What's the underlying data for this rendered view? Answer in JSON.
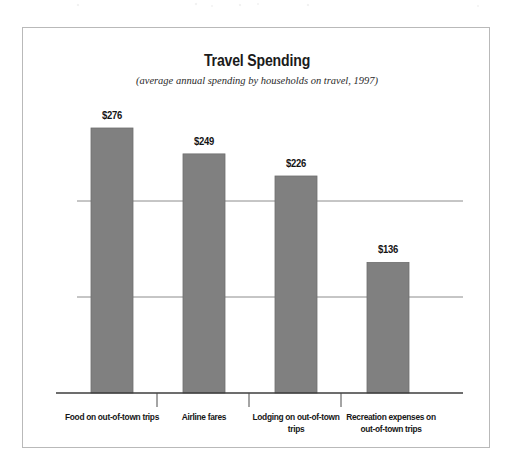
{
  "figure": {
    "title": "Travel Spending",
    "subtitle": "(average annual spending by households on travel, 1997)",
    "border_color": "#b9b9b9",
    "background_color": "#ffffff"
  },
  "chart_data": {
    "type": "bar",
    "title": "Travel Spending",
    "subtitle": "(average annual spending by households on travel, 1997)",
    "xlabel": "",
    "ylabel": "",
    "categories": [
      "Food on out-of-town trips",
      "Airline fares",
      "Lodging on out-of-town trips",
      "Recreation expenses on out-of-town trips"
    ],
    "values": [
      276,
      249,
      226,
      136
    ],
    "value_labels": [
      "$276",
      "$249",
      "$226",
      "$136"
    ],
    "value_prefix": "$",
    "ylim": [
      0,
      300
    ],
    "gridlines": [
      100,
      200
    ],
    "grid": true,
    "legend": "none",
    "bar_color": "#808080",
    "bar_edge_color": "#6e6e6e",
    "axis_color": "#4a4a4a",
    "gridline_color": "#8c8c8c",
    "units": "US dollars per household per year",
    "source_year": 1997
  },
  "bars": [
    {
      "label": "$276",
      "category_line1": "Food on out-of-town trips",
      "category_line2": ""
    },
    {
      "label": "$249",
      "category_line1": "Airline fares",
      "category_line2": ""
    },
    {
      "label": "$226",
      "category_line1": "Lodging on out-of-town",
      "category_line2": "trips"
    },
    {
      "label": "$136",
      "category_line1": "Recreation expenses on",
      "category_line2": "out-of-town trips"
    }
  ]
}
